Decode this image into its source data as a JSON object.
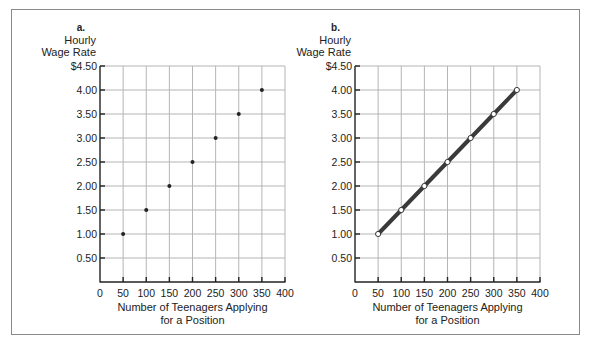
{
  "chart_data": [
    {
      "type": "scatter",
      "panel_label": "a.",
      "title": "",
      "ylabel_lines": [
        "Hourly",
        "Wage Rate"
      ],
      "xlabel_lines": [
        "Number of Teenagers Applying",
        "for a Position"
      ],
      "x": [
        50,
        100,
        150,
        200,
        250,
        300,
        350
      ],
      "y": [
        1.0,
        1.5,
        2.0,
        2.5,
        3.0,
        3.5,
        4.0
      ],
      "xlim": [
        0,
        400
      ],
      "ylim": [
        0,
        4.5
      ],
      "xticks": [
        0,
        50,
        100,
        150,
        200,
        250,
        300,
        350,
        400
      ],
      "xtick_labels": [
        "0",
        "50",
        "100",
        "150",
        "200",
        "250",
        "300",
        "350",
        "400"
      ],
      "yticks": [
        0.5,
        1.0,
        1.5,
        2.0,
        2.5,
        3.0,
        3.5,
        4.0,
        4.5
      ],
      "ytick_labels": [
        "0.50",
        "1.00",
        "1.50",
        "2.00",
        "2.50",
        "3.00",
        "3.50",
        "4.00",
        "$4.50"
      ],
      "grid": true,
      "connect_points": false,
      "marker": "filled-dot"
    },
    {
      "type": "line",
      "panel_label": "b.",
      "title": "",
      "ylabel_lines": [
        "Hourly",
        "Wage Rate"
      ],
      "xlabel_lines": [
        "Number of Teenagers Applying",
        "for a Position"
      ],
      "x": [
        50,
        100,
        150,
        200,
        250,
        300,
        350
      ],
      "y": [
        1.0,
        1.5,
        2.0,
        2.5,
        3.0,
        3.5,
        4.0
      ],
      "xlim": [
        0,
        400
      ],
      "ylim": [
        0,
        4.5
      ],
      "xticks": [
        0,
        50,
        100,
        150,
        200,
        250,
        300,
        350,
        400
      ],
      "xtick_labels": [
        "0",
        "50",
        "100",
        "150",
        "200",
        "250",
        "300",
        "350",
        "400"
      ],
      "yticks": [
        0.5,
        1.0,
        1.5,
        2.0,
        2.5,
        3.0,
        3.5,
        4.0,
        4.5
      ],
      "ytick_labels": [
        "0.50",
        "1.00",
        "1.50",
        "2.00",
        "2.50",
        "3.00",
        "3.50",
        "4.00",
        "$4.50"
      ],
      "grid": true,
      "connect_points": true,
      "marker": "hollow-circle"
    }
  ],
  "colors": {
    "grid": "#b5b5b5",
    "axis": "#222222",
    "line": "#3a3a3a",
    "frame": "#8a8a8a"
  }
}
